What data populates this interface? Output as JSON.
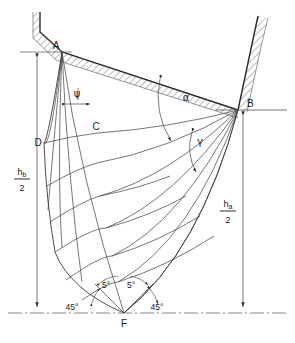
{
  "figure": {
    "type": "slip-line-field-diagram",
    "background": "#ffffff",
    "line_color": "#3a3a3a",
    "text_color": "#1a1a1a",
    "width": 295,
    "height": 343
  },
  "points": [
    {
      "id": "A",
      "label": "A",
      "x": 62,
      "y": 52
    },
    {
      "id": "B",
      "label": "B",
      "x": 238,
      "y": 110
    },
    {
      "id": "C",
      "label": "C",
      "x": 98,
      "y": 133
    },
    {
      "id": "D",
      "label": "D",
      "x": 44,
      "y": 143
    },
    {
      "id": "F",
      "label": "F",
      "x": 124,
      "y": 313
    }
  ],
  "angles": [
    {
      "id": "psi",
      "label": "ψ",
      "x": 77,
      "y": 97,
      "at": "A",
      "kind": "greek"
    },
    {
      "id": "alpha",
      "label": "α",
      "x": 186,
      "y": 101,
      "at": "B",
      "kind": "greek"
    },
    {
      "id": "gamma",
      "label": "γ",
      "x": 200,
      "y": 145,
      "at": "B",
      "kind": "greek"
    },
    {
      "id": "deg5-left",
      "label": "5°",
      "x": 106,
      "y": 288,
      "at": "F",
      "kind": "degree"
    },
    {
      "id": "deg5-right",
      "label": "5°",
      "x": 131,
      "y": 288,
      "at": "F",
      "kind": "degree"
    },
    {
      "id": "deg45-left",
      "label": "45°",
      "x": 72,
      "y": 310,
      "at": "F",
      "kind": "degree"
    },
    {
      "id": "deg45-right",
      "label": "45°",
      "x": 157,
      "y": 310,
      "at": "F",
      "kind": "degree"
    }
  ],
  "dimensions": [
    {
      "id": "hb-over-2",
      "numerator": "h",
      "subscript": "b",
      "denominator": "2",
      "side": "left",
      "label_x": 22,
      "label_y": 178,
      "line_x": 37,
      "y_top": 52,
      "y_bottom": 313
    },
    {
      "id": "ha-over-2",
      "numerator": "h",
      "subscript": "a",
      "denominator": "2",
      "side": "right",
      "label_x": 228,
      "label_y": 210,
      "line_x": 243,
      "y_top": 110,
      "y_bottom": 313
    }
  ],
  "reference_lines": [
    {
      "id": "baseline-bottom",
      "kind": "dash-dot",
      "x1": 8,
      "y1": 313,
      "x2": 287,
      "y2": 313
    },
    {
      "id": "horizontal-through-B",
      "kind": "solid",
      "x1": 216,
      "y1": 110,
      "x2": 287,
      "y2": 110
    },
    {
      "id": "horizontal-through-A",
      "kind": "solid",
      "x1": 20,
      "y1": 52,
      "x2": 72,
      "y2": 52
    }
  ],
  "walls": [
    {
      "id": "upper-die-wall",
      "description": "hatched upper tool surface from top-left down to B",
      "path": "M 40 12 L 40 32 L 62 52 L 238 110",
      "hatch_side": "above"
    },
    {
      "id": "right-die-wall",
      "description": "hatched right tool surface above B",
      "path": "M 238 110 L 252 44 L 258 16",
      "hatch_side": "right"
    }
  ],
  "mesh": {
    "description": "curvilinear slip-line net between A, B and F",
    "alpha_lines": 8,
    "beta_lines": 5
  }
}
